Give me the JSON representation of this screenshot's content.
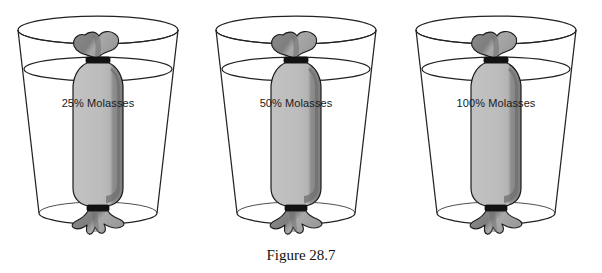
{
  "figure": {
    "caption": "Figure 28.7",
    "background_color": "#ffffff",
    "outline_color": "#1b1b1b"
  },
  "colors": {
    "bag_fill": "#b9b9b9",
    "bag_shadow": "#868686",
    "bag_dark": "#6f6f6f",
    "tie_band": "#111111",
    "glass_line": "#222222",
    "label_text": "#1a1a1a"
  },
  "beakers": [
    {
      "id": "beaker-left",
      "label": "25% Molasses",
      "concentration": "25%",
      "contents": "Molasses",
      "x": 0
    },
    {
      "id": "beaker-middle",
      "label": "50% Molasses",
      "concentration": "50%",
      "contents": "Molasses",
      "x": 198
    },
    {
      "id": "beaker-right",
      "label": "100% Molasses",
      "concentration": "100%",
      "contents": "Molasses",
      "x": 398
    }
  ]
}
